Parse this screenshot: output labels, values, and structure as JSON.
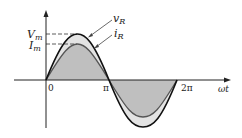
{
  "diagram": {
    "type": "ac-resistor-waveforms",
    "curves": [
      {
        "name": "v_R",
        "label_main": "v",
        "label_sub": "R",
        "peak_label": "V",
        "peak_sub": "m",
        "color": "#111111"
      },
      {
        "name": "i_R",
        "label_main": "i",
        "label_sub": "R",
        "peak_label": "I",
        "peak_sub": "m",
        "color": "#555555"
      }
    ],
    "x_axis": {
      "label": "ωt",
      "ticks": [
        "0",
        "π",
        "2π"
      ]
    },
    "fill_colors": {
      "inner": "#bfbfbf",
      "outer": "#e3e3e3"
    }
  },
  "labels": {
    "vm_main": "V",
    "vm_sub": "m",
    "im_main": "I",
    "im_sub": "m",
    "vr_main": "v",
    "vr_sub": "R",
    "ir_main": "i",
    "ir_sub": "R",
    "tick_0": "0",
    "tick_pi": "π",
    "tick_2pi": "2π",
    "x_label": "ωt"
  }
}
